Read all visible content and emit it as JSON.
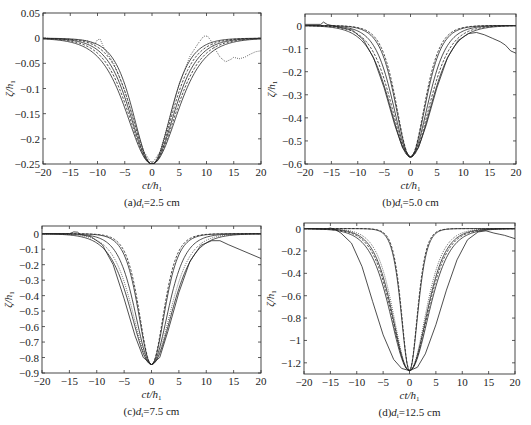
{
  "figure": {
    "xlabel_main": "ct/h",
    "xlabel_sub": "1",
    "ylabel_main": "ζ/h",
    "ylabel_sub": "1"
  },
  "chart_data": [
    {
      "id": "a",
      "type": "line",
      "caption_prefix": "(a)",
      "caption_var": "d",
      "caption_var_sub": "i",
      "caption_value": "=2.5 cm",
      "xlabel": "ct/h1",
      "ylabel": "ζ/h1",
      "xlim": [
        -20,
        20
      ],
      "ylim": [
        -0.25,
        0.05
      ],
      "xticks": [
        -20,
        -15,
        -10,
        -5,
        0,
        5,
        10,
        15,
        20
      ],
      "yticks": [
        0.05,
        0,
        -0.05,
        -0.1,
        -0.15,
        -0.2,
        -0.25
      ],
      "ytick_labels": [
        "0.05",
        "0",
        "−0.05",
        "−0.1",
        "−0.15",
        "−0.2",
        "−0.25"
      ],
      "box": [
        43,
        13,
        261,
        164
      ],
      "grid": false,
      "legend": null,
      "series": [
        {
          "name": "profile-1",
          "style": "solid",
          "amplitude": -0.25,
          "width": 4.6
        },
        {
          "name": "profile-2",
          "style": "dashed",
          "amplitude": -0.25,
          "width": 5.0
        },
        {
          "name": "profile-3",
          "style": "solid",
          "amplitude": -0.25,
          "width": 5.4
        },
        {
          "name": "profile-4",
          "style": "dashed",
          "amplitude": -0.25,
          "width": 5.8
        },
        {
          "name": "profile-5",
          "style": "solid",
          "amplitude": -0.25,
          "width": 6.2
        },
        {
          "name": "measured",
          "style": "dotted",
          "points": [
            [
              -20,
              0
            ],
            [
              -14,
              -0.003
            ],
            [
              -12,
              -0.005
            ],
            [
              -10.5,
              -0.012
            ],
            [
              -10,
              -0.003
            ],
            [
              -9.5,
              -0.002
            ],
            [
              -8.8,
              -0.02
            ],
            [
              -7,
              -0.05
            ],
            [
              -5,
              -0.105
            ],
            [
              -3,
              -0.175
            ],
            [
              -1.5,
              -0.225
            ],
            [
              0,
              -0.25
            ],
            [
              1.5,
              -0.225
            ],
            [
              3,
              -0.17
            ],
            [
              5,
              -0.09
            ],
            [
              7,
              -0.035
            ],
            [
              8.5,
              -0.01
            ],
            [
              9.5,
              0.004
            ],
            [
              10.2,
              0.004
            ],
            [
              10.8,
              -0.005
            ],
            [
              11.5,
              -0.02
            ],
            [
              12.5,
              -0.038
            ],
            [
              13.5,
              -0.047
            ],
            [
              14.5,
              -0.042
            ],
            [
              15,
              -0.038
            ],
            [
              16,
              -0.041
            ],
            [
              17,
              -0.038
            ],
            [
              18,
              -0.032
            ],
            [
              19,
              -0.027
            ],
            [
              20,
              -0.025
            ]
          ]
        }
      ]
    },
    {
      "id": "b",
      "type": "line",
      "caption_prefix": "(b)",
      "caption_var": "d",
      "caption_var_sub": "i",
      "caption_value": "=5.0 cm",
      "xlabel": "ct/h1",
      "ylabel": "ζ/h1",
      "xlim": [
        -20,
        20
      ],
      "ylim": [
        -0.6,
        0.05
      ],
      "xticks": [
        -20,
        -15,
        -10,
        -5,
        0,
        5,
        10,
        15,
        20
      ],
      "yticks": [
        0,
        -0.1,
        -0.2,
        -0.3,
        -0.4,
        -0.5,
        -0.6
      ],
      "ytick_labels": [
        "0",
        "−0.1",
        "−0.2",
        "−0.3",
        "−0.4",
        "−0.5",
        "−0.6"
      ],
      "box": [
        305,
        14,
        516,
        164
      ],
      "grid": false,
      "legend": null,
      "series": [
        {
          "name": "profile-1",
          "style": "dashed",
          "amplitude": -0.57,
          "width": 3.6
        },
        {
          "name": "profile-2",
          "style": "solid",
          "amplitude": -0.57,
          "width": 3.8
        },
        {
          "name": "profile-3",
          "style": "solid",
          "amplitude": -0.57,
          "width": 4.4
        },
        {
          "name": "profile-4",
          "style": "dashed",
          "amplitude": -0.57,
          "width": 4.9
        },
        {
          "name": "profile-5",
          "style": "solid",
          "amplitude": -0.57,
          "width": 5.3
        },
        {
          "name": "measured",
          "style": "solid",
          "points": [
            [
              -20,
              0.005
            ],
            [
              -17,
              0.005
            ],
            [
              -16.5,
              0.015
            ],
            [
              -15.8,
              0.005
            ],
            [
              -14,
              -0.005
            ],
            [
              -11,
              -0.02
            ],
            [
              -9,
              -0.06
            ],
            [
              -7,
              -0.14
            ],
            [
              -5,
              -0.27
            ],
            [
              -3,
              -0.43
            ],
            [
              -1.5,
              -0.53
            ],
            [
              0,
              -0.57
            ],
            [
              1.5,
              -0.53
            ],
            [
              3,
              -0.43
            ],
            [
              5,
              -0.27
            ],
            [
              7,
              -0.14
            ],
            [
              9,
              -0.065
            ],
            [
              11,
              -0.035
            ],
            [
              12.5,
              -0.03
            ],
            [
              14,
              -0.04
            ],
            [
              15.5,
              -0.055
            ],
            [
              17,
              -0.07
            ],
            [
              18,
              -0.085
            ],
            [
              19,
              -0.11
            ],
            [
              20,
              -0.12
            ]
          ]
        }
      ]
    },
    {
      "id": "c",
      "type": "line",
      "caption_prefix": "(c)",
      "caption_var": "d",
      "caption_var_sub": "i",
      "caption_value": "=7.5 cm",
      "xlabel": "ct/h1",
      "ylabel": "ζ/h1",
      "xlim": [
        -20,
        20
      ],
      "ylim": [
        -0.9,
        0.05
      ],
      "xticks": [
        -20,
        -15,
        -10,
        -5,
        0,
        5,
        10,
        15,
        20
      ],
      "yticks": [
        0,
        -0.1,
        -0.2,
        -0.3,
        -0.4,
        -0.5,
        -0.6,
        -0.7,
        -0.8,
        -0.9
      ],
      "ytick_labels": [
        "0",
        "−0.1",
        "−0.2",
        "−0.3",
        "−0.4",
        "−0.5",
        "−0.6",
        "−0.7",
        "−0.8",
        "−0.9"
      ],
      "box": [
        42,
        226,
        261,
        373
      ],
      "grid": false,
      "legend": null,
      "series": [
        {
          "name": "profile-1",
          "style": "dashed",
          "amplitude": -0.845,
          "width": 3.0
        },
        {
          "name": "profile-2",
          "style": "solid",
          "amplitude": -0.845,
          "width": 3.2
        },
        {
          "name": "profile-3",
          "style": "solid",
          "amplitude": -0.845,
          "width": 4.0
        },
        {
          "name": "profile-4",
          "style": "dotted",
          "amplitude": -0.845,
          "width": 4.6
        },
        {
          "name": "profile-5",
          "style": "solid",
          "amplitude": -0.845,
          "width": 5.0
        },
        {
          "name": "measured",
          "style": "solid",
          "points": [
            [
              -20,
              0
            ],
            [
              -15,
              0
            ],
            [
              -14.2,
              0.012
            ],
            [
              -13.5,
              0.01
            ],
            [
              -13,
              -0.005
            ],
            [
              -11,
              -0.02
            ],
            [
              -9,
              -0.07
            ],
            [
              -7,
              -0.2
            ],
            [
              -5,
              -0.42
            ],
            [
              -3,
              -0.66
            ],
            [
              -1.5,
              -0.8
            ],
            [
              0,
              -0.845
            ],
            [
              1.5,
              -0.8
            ],
            [
              3,
              -0.63
            ],
            [
              5,
              -0.38
            ],
            [
              7,
              -0.18
            ],
            [
              9,
              -0.075
            ],
            [
              11,
              -0.045
            ],
            [
              12.5,
              -0.045
            ],
            [
              14,
              -0.07
            ],
            [
              16,
              -0.1
            ],
            [
              18,
              -0.13
            ],
            [
              20,
              -0.16
            ]
          ]
        }
      ]
    },
    {
      "id": "d",
      "type": "line",
      "caption_prefix": "(d)",
      "caption_var": "d",
      "caption_var_sub": "i",
      "caption_value": "=12.5 cm",
      "xlabel": "ct/h1",
      "ylabel": "ζ/h1",
      "xlim": [
        -20,
        20
      ],
      "ylim": [
        -1.3,
        0.05
      ],
      "xticks": [
        -20,
        -15,
        -10,
        -5,
        0,
        5,
        10,
        15,
        20
      ],
      "yticks": [
        0,
        -0.2,
        -0.4,
        -0.6,
        -0.8,
        -1,
        -1.2
      ],
      "ytick_labels": [
        "0",
        "−0.2",
        "−0.4",
        "−0.6",
        "−0.8",
        "−1",
        "−1.2"
      ],
      "box": [
        304,
        223,
        515,
        374
      ],
      "grid": false,
      "legend": null,
      "series": [
        {
          "name": "profile-1",
          "style": "dashed",
          "amplitude": -1.27,
          "width": 2.0
        },
        {
          "name": "profile-2",
          "style": "solid",
          "amplitude": -1.27,
          "width": 2.1
        },
        {
          "name": "profile-3",
          "style": "dotted",
          "amplitude": -1.27,
          "width": 4.1
        },
        {
          "name": "profile-4",
          "style": "solid",
          "amplitude": -1.27,
          "width": 4.4
        },
        {
          "name": "profile-5",
          "style": "dashed",
          "amplitude": -1.27,
          "width": 4.6
        },
        {
          "name": "profile-6",
          "style": "solid",
          "amplitude": -1.27,
          "width": 4.9
        },
        {
          "name": "measured",
          "style": "solid",
          "points": [
            [
              -20,
              0
            ],
            [
              -16,
              -0.005
            ],
            [
              -15,
              0.005
            ],
            [
              -14,
              -0.01
            ],
            [
              -13,
              -0.04
            ],
            [
              -11,
              -0.13
            ],
            [
              -9,
              -0.34
            ],
            [
              -7,
              -0.65
            ],
            [
              -5,
              -0.95
            ],
            [
              -3,
              -1.17
            ],
            [
              -1.5,
              -1.25
            ],
            [
              0,
              -1.27
            ],
            [
              1.5,
              -1.24
            ],
            [
              3,
              -1.12
            ],
            [
              5,
              -0.86
            ],
            [
              7,
              -0.55
            ],
            [
              9,
              -0.28
            ],
            [
              11,
              -0.1
            ],
            [
              13,
              -0.03
            ],
            [
              14.5,
              -0.02
            ],
            [
              16,
              -0.04
            ],
            [
              17,
              -0.05
            ],
            [
              18,
              -0.06
            ],
            [
              19,
              -0.075
            ],
            [
              20,
              -0.09
            ]
          ]
        }
      ]
    }
  ]
}
